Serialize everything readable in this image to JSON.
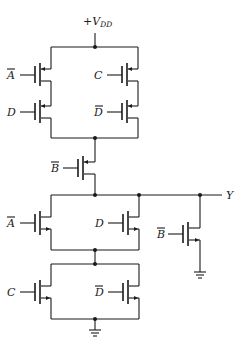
{
  "diagram": {
    "type": "CMOS logic gate transistor schematic",
    "supply_label": "+V",
    "supply_subscript": "DD",
    "output_label": "Y",
    "pull_up_network": {
      "branches": [
        {
          "side": "left",
          "transistors": [
            {
              "type": "PMOS",
              "gate": "A",
              "inverted": true
            },
            {
              "type": "PMOS",
              "gate": "D",
              "inverted": false
            }
          ]
        },
        {
          "side": "right",
          "transistors": [
            {
              "type": "PMOS",
              "gate": "C",
              "inverted": false
            },
            {
              "type": "PMOS",
              "gate": "D",
              "inverted": true
            }
          ]
        }
      ],
      "series_transistor": {
        "type": "PMOS",
        "gate": "B",
        "inverted": true
      }
    },
    "pull_down_network": {
      "upper_parallel": [
        {
          "type": "NMOS",
          "gate": "A",
          "inverted": true
        },
        {
          "type": "NMOS",
          "gate": "D",
          "inverted": false
        }
      ],
      "lower_parallel": [
        {
          "type": "NMOS",
          "gate": "C",
          "inverted": false
        },
        {
          "type": "NMOS",
          "gate": "D",
          "inverted": true
        }
      ],
      "separate_transistor": {
        "type": "NMOS",
        "gate": "B",
        "inverted": true
      }
    },
    "labels": {
      "pu_left_top": "A",
      "pu_left_bottom": "D",
      "pu_right_top": "C",
      "pu_right_bottom": "D",
      "pu_series": "B",
      "pd_upper_left": "A",
      "pd_upper_right": "D",
      "pd_lower_left": "C",
      "pd_lower_right": "D",
      "pd_right": "B"
    }
  }
}
